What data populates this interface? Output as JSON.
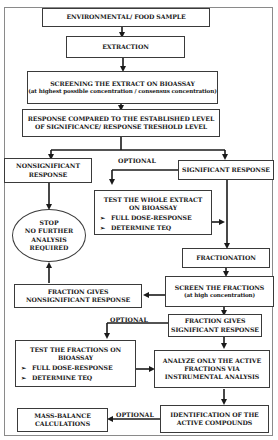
{
  "diagram": {
    "nodes": {
      "sample": "ENVIRONMENTAL/ FOOD SAMPLE",
      "extraction": "EXTRACTION",
      "screening_title": "SCREENING THE EXTRACT ON BIOASSAY",
      "screening_sub": "(at highest possible concentration / consensus concentration)",
      "compare_line1": "RESPONSE COMPARED TO THE ESTABLISHED LEVEL",
      "compare_line2": "OF SIGNIFICANCE/ RESPONSE TRESHOLD LEVEL",
      "nonsig_line1": "NONSIGNIFICANT",
      "nonsig_line2": "RESPONSE",
      "sig": "SIGNIFICANT RESPONSE",
      "test_whole_line1": "TEST THE WHOLE EXTRACT",
      "test_whole_line2": "ON BIOASSAY",
      "test_whole_items": [
        "FULL DOSE-RESPONSE",
        "DETERMINE  TEQ"
      ],
      "stop_lines": [
        "STOP",
        "NO FURTHER",
        "ANALYSIS",
        "REQUIRED"
      ],
      "fractionation": "FRACTIONATION",
      "screen_fractions": "SCREEN THE FRACTIONS",
      "screen_fractions_sub": "(at high concentration)",
      "frac_nonsig_line1": "FRACTION GIVES",
      "frac_nonsig_line2": "NONSIGNIFICANT RESPONSE",
      "frac_sig_line1": "FRACTION GIVES",
      "frac_sig_line2": "SIGNIFICANT RESPONSE",
      "test_fractions_line1": "TEST THE FRACTIONS ON",
      "test_fractions_line2": "BIOASSAY",
      "test_fractions_items": [
        "FULL DOSE-RESPONSE",
        "DETERMINE TEQ"
      ],
      "analyze_line1": "ANALYZE ONLY THE ACTIVE",
      "analyze_line2": "FRACTIONS VIA",
      "analyze_line3": "INSTRUMENTAL ANALYSIS",
      "mass_line1": "MASS-BALANCE",
      "mass_line2": "CALCULATIONS",
      "ident_line1": "IDENTIFICATION OF THE",
      "ident_line2": "ACTIVE COMPOUNDS"
    },
    "edge_labels": {
      "optional_1": "OPTIONAL",
      "optional_2": "OPTIONAL",
      "optional_3": "OPTIONAL"
    },
    "bullet_glyph": "➢",
    "colors": {
      "line": "#1a1a1a",
      "border": "#3a3a3a",
      "frame": "#8a8a8a",
      "background": "#ffffff"
    }
  }
}
